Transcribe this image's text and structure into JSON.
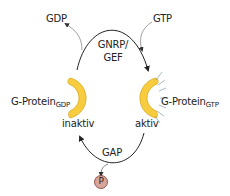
{
  "diagram": {
    "type": "G-protein activation cycle",
    "labels": {
      "gdp": "GDP",
      "gtp": "GTP",
      "gef_line1": "GNRP/",
      "gef_line2": "GEF",
      "gprotein_gdp_main": "G-Protein",
      "gprotein_gdp_sub": "GDP",
      "gprotein_gtp_main": "G-Protein",
      "gprotein_gtp_sub": "GTP",
      "inactive": "inaktiv",
      "active": "aktiv",
      "gap": "GAP",
      "phosphate": "P"
    },
    "colors": {
      "protein_fill": "#f7cc3e",
      "protein_stroke": "#d9a81a",
      "phosphate_fill": "#d9a59a",
      "phosphate_stroke": "#7a3a2e",
      "arrow": "#222222",
      "thin_arrow": "#666666",
      "rays": "#6a8fa8"
    },
    "states": [
      {
        "name": "G-Protein-GDP",
        "status": "inaktiv"
      },
      {
        "name": "G-Protein-GTP",
        "status": "aktiv"
      }
    ],
    "transitions": [
      {
        "from": "G-Protein-GDP",
        "to": "G-Protein-GTP",
        "catalyst": "GNRP/GEF",
        "releases": "GDP",
        "binds": "GTP"
      },
      {
        "from": "G-Protein-GTP",
        "to": "G-Protein-GDP",
        "catalyst": "GAP",
        "releases": "P"
      }
    ]
  }
}
